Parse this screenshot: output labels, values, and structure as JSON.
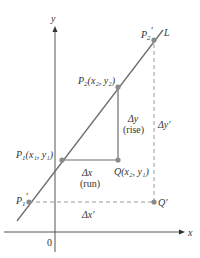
{
  "diagram": {
    "axes": {
      "x_label": "x",
      "y_label": "y",
      "origin_label": "0"
    },
    "line_label": "L",
    "points": {
      "P1": {
        "name": "P",
        "sub": "1",
        "coords": "(x₁, y₁)"
      },
      "P2": {
        "name": "P",
        "sub": "2",
        "coords": "(x₂, y₂)"
      },
      "Q": {
        "name": "Q",
        "coords": "(x₂, y₁)"
      },
      "P1prime": {
        "name": "P",
        "sub": "1",
        "prime": "′"
      },
      "P2prime": {
        "name": "P",
        "sub": "2",
        "prime": "′"
      },
      "Qprime": {
        "name": "Q",
        "prime": "′"
      }
    },
    "annotations": {
      "dx": "Δx",
      "run": "(run)",
      "dy": "Δy",
      "rise": "(rise)",
      "dx_prime": "Δx′",
      "dy_prime": "Δy′"
    },
    "colors": {
      "line": "#6e6e6e",
      "point": "#8a8a8a",
      "axis": "#555555",
      "dashed": "#9a9a9a"
    }
  }
}
